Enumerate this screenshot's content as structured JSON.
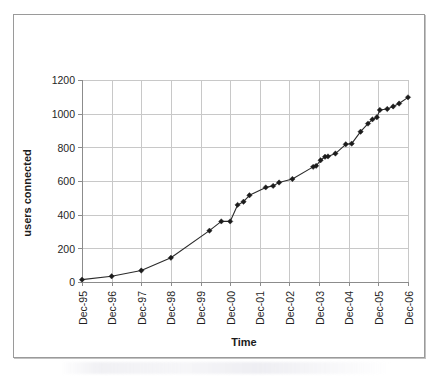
{
  "chart_data": {
    "type": "line",
    "title": "",
    "xlabel": "Time",
    "ylabel": "users connected",
    "xtick_labels": [
      "Dec-95",
      "Dec-96",
      "Dec-97",
      "Dec-98",
      "Dec-99",
      "Dec-00",
      "Dec-01",
      "Dec-02",
      "Dec-03",
      "Dec-04",
      "Dec-05",
      "Dec-06"
    ],
    "ytick_labels": [
      "0",
      "200",
      "400",
      "600",
      "800",
      "1000",
      "1200"
    ],
    "ylim": [
      0,
      1200
    ],
    "xlim": [
      1995.0,
      2006.0
    ],
    "ytick_values": [
      0,
      200,
      400,
      600,
      800,
      1000,
      1200
    ],
    "xtick_values": [
      1995,
      1996,
      1997,
      1998,
      1999,
      2000,
      2001,
      2002,
      2003,
      2004,
      2005,
      2006
    ],
    "grid": "horizontal-and-vertical",
    "legend": "none",
    "marker": "diamond",
    "line_color": "#2b2b2b",
    "marker_color": "#1c1c1c",
    "grid_color": "#c8c8c8",
    "axis_color": "#8c8c8c",
    "series": [
      {
        "name": "users connected",
        "points": [
          {
            "x": 1995.0,
            "label": "Dec-95",
            "y": 14
          },
          {
            "x": 1996.0,
            "label": "Dec-96",
            "y": 34
          },
          {
            "x": 1997.0,
            "label": "Dec-97",
            "y": 68
          },
          {
            "x": 1998.0,
            "label": "Dec-98",
            "y": 144
          },
          {
            "x": 1999.3,
            "label": "Apr-99",
            "y": 305
          },
          {
            "x": 1999.7,
            "label": "Sep-99",
            "y": 360
          },
          {
            "x": 2000.0,
            "label": "Dec-00",
            "y": 360
          },
          {
            "x": 2000.25,
            "label": "Mar-01",
            "y": 458
          },
          {
            "x": 2000.45,
            "label": "Jun-01",
            "y": 477
          },
          {
            "x": 2000.65,
            "label": "Aug-01",
            "y": 515
          },
          {
            "x": 2001.2,
            "label": "Mar-02",
            "y": 562
          },
          {
            "x": 2001.45,
            "label": "Jun-02",
            "y": 571
          },
          {
            "x": 2001.65,
            "label": "Aug-02",
            "y": 591
          },
          {
            "x": 2002.1,
            "label": "Feb-03",
            "y": 612
          },
          {
            "x": 2002.8,
            "label": "Oct-03",
            "y": 684
          },
          {
            "x": 2002.9,
            "label": "Nov-03",
            "y": 690
          },
          {
            "x": 2003.05,
            "label": "Jan-04",
            "y": 723
          },
          {
            "x": 2003.2,
            "label": "Mar-04",
            "y": 744
          },
          {
            "x": 2003.3,
            "label": "Apr-04",
            "y": 746
          },
          {
            "x": 2003.55,
            "label": "Jul-04",
            "y": 763
          },
          {
            "x": 2003.9,
            "label": "Nov-04",
            "y": 818
          },
          {
            "x": 2004.1,
            "label": "Feb-05",
            "y": 822
          },
          {
            "x": 2004.4,
            "label": "May-05",
            "y": 893
          },
          {
            "x": 2004.65,
            "label": "Aug-05",
            "y": 941
          },
          {
            "x": 2004.8,
            "label": "Oct-05",
            "y": 966
          },
          {
            "x": 2004.95,
            "label": "Nov-05",
            "y": 979
          },
          {
            "x": 2005.05,
            "label": "Jan-06",
            "y": 1022
          },
          {
            "x": 2005.3,
            "label": "Apr-06",
            "y": 1028
          },
          {
            "x": 2005.5,
            "label": "Jun-06",
            "y": 1043
          },
          {
            "x": 2005.7,
            "label": "Aug-06",
            "y": 1060
          },
          {
            "x": 2006.0,
            "label": "Dec-06",
            "y": 1097
          }
        ]
      }
    ]
  }
}
